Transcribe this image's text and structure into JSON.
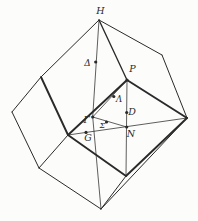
{
  "diagram": {
    "type": "polyhedron-symmetry-points-figure",
    "background_color": "#fcfcfb",
    "line_color": "#2a2a2a",
    "canvas": {
      "width": 198,
      "height": 221
    },
    "points": {
      "H": {
        "x": 99,
        "y": 20
      },
      "vUR": {
        "x": 162,
        "y": 55
      },
      "vR": {
        "x": 187,
        "y": 118
      },
      "P": {
        "x": 127,
        "y": 80
      },
      "vUL": {
        "x": 41,
        "y": 77
      },
      "vL": {
        "x": 12,
        "y": 112
      },
      "vLL": {
        "x": 39,
        "y": 168
      },
      "vB": {
        "x": 101,
        "y": 209
      },
      "vFB": {
        "x": 126,
        "y": 176
      },
      "vFL": {
        "x": 68,
        "y": 135
      },
      "Gamma": {
        "x": 92.7,
        "y": 117
      },
      "N": {
        "x": 126.7,
        "y": 127
      },
      "Delta": {
        "x": 95.7,
        "y": 62
      },
      "Lambda": {
        "x": 113.8,
        "y": 96.5
      },
      "Sigma": {
        "x": 106.5,
        "y": 122
      },
      "D": {
        "x": 126.7,
        "y": 112.5
      },
      "G": {
        "x": 86,
        "y": 132.4
      }
    },
    "edges": [
      {
        "from": "H",
        "to": "vUR",
        "style": "thin"
      },
      {
        "from": "vUR",
        "to": "vR",
        "style": "thin"
      },
      {
        "from": "H",
        "to": "vUL",
        "style": "thin"
      },
      {
        "from": "vUL",
        "to": "vL",
        "style": "thin"
      },
      {
        "from": "vL",
        "to": "vLL",
        "style": "thin"
      },
      {
        "from": "vLL",
        "to": "vB",
        "style": "thin"
      },
      {
        "from": "vB",
        "to": "vR",
        "style": "thin"
      },
      {
        "from": "vB",
        "to": "vFB",
        "style": "thin"
      },
      {
        "from": "vLL",
        "to": "vFL",
        "style": "thin"
      },
      {
        "from": "vUL",
        "to": "vFL",
        "style": "thick"
      },
      {
        "from": "vFL",
        "to": "vFB",
        "style": "thick"
      },
      {
        "from": "vFB",
        "to": "vR",
        "style": "thick"
      },
      {
        "from": "vR",
        "to": "P",
        "style": "thick"
      },
      {
        "from": "P",
        "to": "vFL",
        "style": "thick"
      },
      {
        "from": "H",
        "to": "P",
        "style": "medium"
      }
    ],
    "construction_lines": [
      {
        "from": "H",
        "to": "Gamma"
      },
      {
        "from": "Gamma",
        "to": "vB"
      },
      {
        "from": "Gamma",
        "to": "P"
      },
      {
        "from": "Gamma",
        "to": "N"
      },
      {
        "from": "vFL",
        "to": "vR"
      },
      {
        "from": "P",
        "to": "vFB"
      }
    ],
    "dots": [
      "P",
      "Gamma",
      "N",
      "Delta",
      "Lambda",
      "Sigma",
      "D",
      "G"
    ],
    "dot_radius": 1.6,
    "labels": [
      {
        "name": "H",
        "text": "H",
        "x": 100.5,
        "y": 14,
        "anchor": "middle",
        "size": 9.5
      },
      {
        "name": "Delta",
        "text": "Δ",
        "x": 87.5,
        "y": 65.5,
        "anchor": "middle",
        "size": 9
      },
      {
        "name": "P",
        "text": "P",
        "x": 132.5,
        "y": 72,
        "anchor": "middle",
        "size": 9.5
      },
      {
        "name": "Lambda",
        "text": "Λ",
        "x": 119,
        "y": 101.5,
        "anchor": "middle",
        "size": 8.5
      },
      {
        "name": "D",
        "text": "D",
        "x": 132,
        "y": 115,
        "anchor": "middle",
        "size": 9.5
      },
      {
        "name": "Gamma",
        "text": "Γ",
        "x": 86.5,
        "y": 122.5,
        "anchor": "middle",
        "size": 9
      },
      {
        "name": "Sigma",
        "text": "Σ",
        "x": 102.3,
        "y": 127.5,
        "anchor": "middle",
        "size": 8
      },
      {
        "name": "N",
        "text": "N",
        "x": 131,
        "y": 136.5,
        "anchor": "middle",
        "size": 9.5
      },
      {
        "name": "G",
        "text": "G",
        "x": 88,
        "y": 140.5,
        "anchor": "middle",
        "size": 9.5
      }
    ]
  }
}
